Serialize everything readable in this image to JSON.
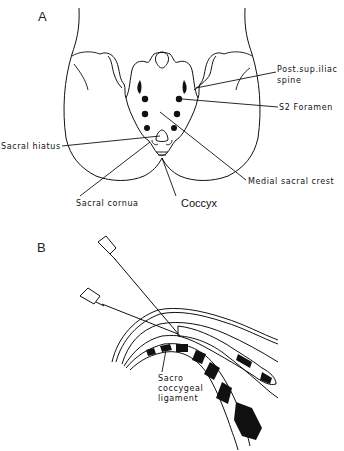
{
  "figure": {
    "panel_a": {
      "label": "A",
      "labels": {
        "post_sup_iliac_spine_line1": "Post.sup.iliac",
        "post_sup_iliac_spine_line2": "spine",
        "s2_foramen": "S2 Foramen",
        "sacral_hiatus": "Sacral hiatus",
        "medial_sacral_crest": "Medial sacral crest",
        "sacral_cornua": "Sacral cornua",
        "coccyx": "Coccyx"
      }
    },
    "panel_b": {
      "label": "B",
      "labels": {
        "ligament_line1": "Sacro",
        "ligament_line2": "coccygeal",
        "ligament_line3": "ligament"
      }
    }
  }
}
